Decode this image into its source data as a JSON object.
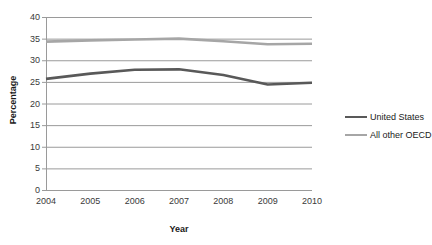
{
  "chart_data": {
    "type": "line",
    "title": "",
    "xlabel": "Year",
    "ylabel": "Percentage",
    "categories": [
      "2004",
      "2005",
      "2006",
      "2007",
      "2008",
      "2009",
      "2010"
    ],
    "x": [
      2004,
      2005,
      2006,
      2007,
      2008,
      2009,
      2010
    ],
    "series": [
      {
        "name": "United States",
        "color": "#595959",
        "values": [
          25.7,
          26.9,
          27.8,
          27.9,
          26.6,
          24.4,
          24.8
        ]
      },
      {
        "name": "All other OECD",
        "color": "#a6a6a6",
        "values": [
          34.3,
          34.6,
          34.8,
          35.0,
          34.4,
          33.7,
          33.8
        ]
      }
    ],
    "ylim": [
      0,
      40
    ],
    "yticks": [
      0,
      5,
      10,
      15,
      20,
      25,
      30,
      35,
      40
    ],
    "ytick_labels": [
      "0",
      "5",
      "10",
      "15",
      "20",
      "25",
      "30",
      "35",
      "40"
    ],
    "grid": "horizontal",
    "legend_position": "right",
    "legend": [
      "United States",
      "All other OECD"
    ]
  },
  "axes": {
    "y_title": "Percentage",
    "x_title": "Year"
  },
  "legend": {
    "items": [
      {
        "label": "United States",
        "color": "#595959",
        "icon": "line-swatch-icon"
      },
      {
        "label": "All other OECD",
        "color": "#a6a6a6",
        "icon": "line-swatch-icon"
      }
    ]
  },
  "style": {
    "grid_color": "#9a9a9a",
    "axis_color": "#9a9a9a",
    "plot_background": "#ffffff"
  }
}
